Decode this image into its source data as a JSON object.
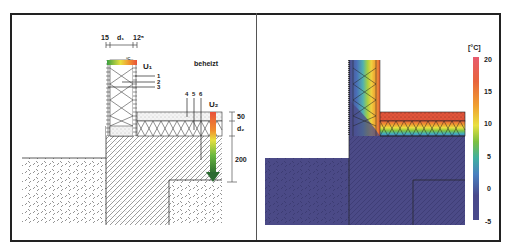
{
  "left_panel": {
    "title": "Construction detail",
    "dimensions_top": {
      "left": "15",
      "middle": "d₁",
      "right": "12⁵"
    },
    "labels": {
      "u1": "U₁",
      "u2": "U₂",
      "heated_zone": "beheizt",
      "temp_mark": "°C"
    },
    "layer_callouts": [
      "1",
      "2",
      "3",
      "4",
      "5",
      "6"
    ],
    "dimensions_right": {
      "top": "50",
      "middle": "d₂",
      "bottom": "200"
    }
  },
  "right_panel": {
    "title": "Temperature distribution",
    "legend": {
      "unit": "[°C]",
      "ticks": [
        "20",
        "15",
        "10",
        "5",
        "0",
        "-5"
      ],
      "colors": [
        "#e85a6e",
        "#e8643c",
        "#f0a030",
        "#e8e040",
        "#7cc040",
        "#40b0a0",
        "#4a80c0",
        "#4a4a8c"
      ]
    }
  },
  "colors": {
    "frame": "#222222",
    "line": "#333333",
    "cold": "#4b4a87",
    "warm": "#e0543a",
    "gradient_green": "#3aa040",
    "gradient_yellow": "#e8e040",
    "gradient_red": "#e8503a"
  }
}
